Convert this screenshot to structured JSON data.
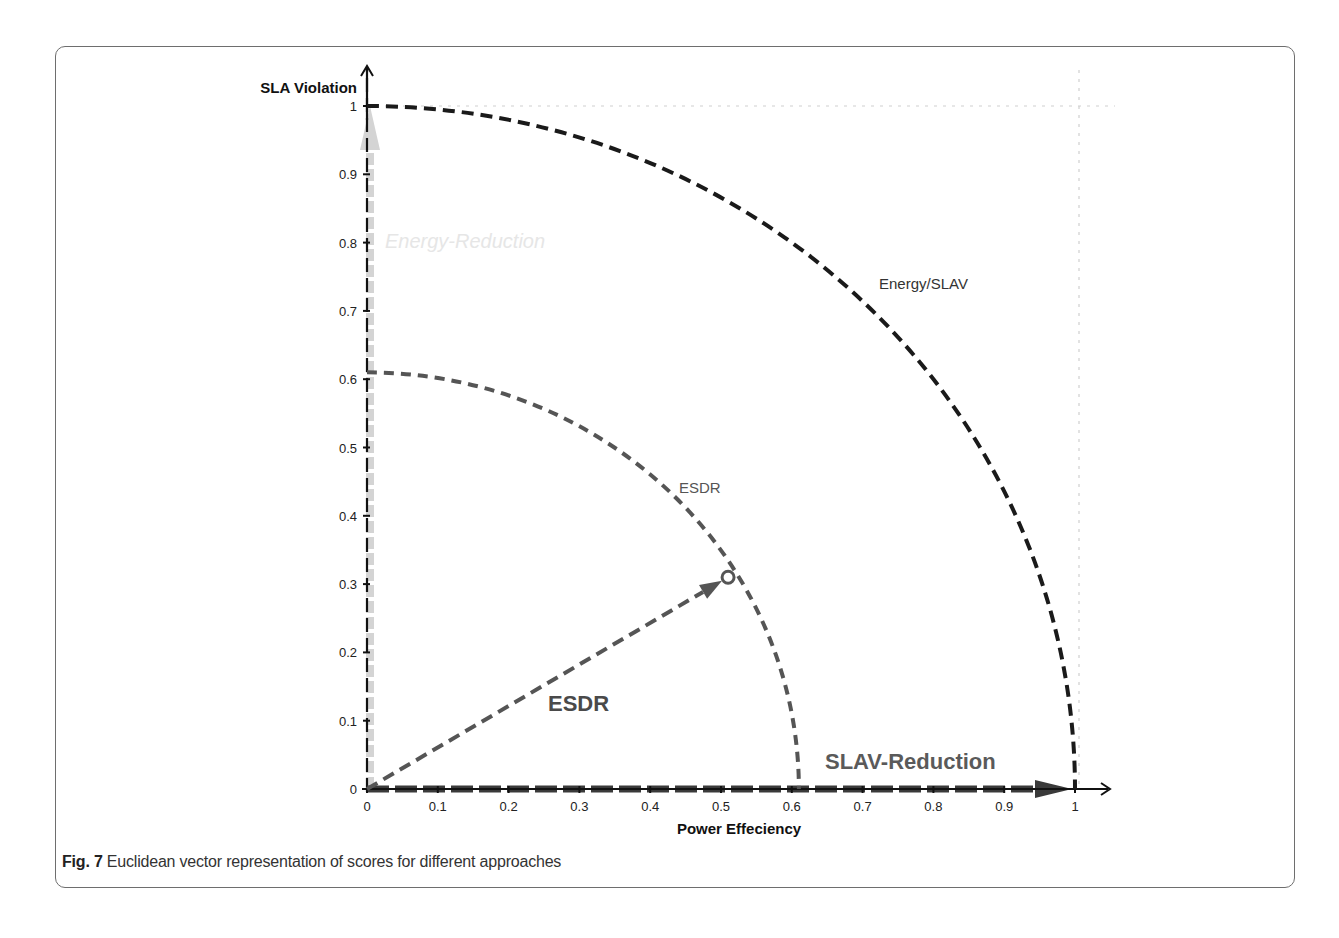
{
  "caption": {
    "label": "Fig. 7",
    "text": " Euclidean vector representation of scores for different approaches"
  },
  "colors": {
    "axis": "#111111",
    "outer_arc": "#1a1a1a",
    "inner_arc": "#555555",
    "vector": "#555555",
    "energy_arrow": "#d4d4d4",
    "slav_arrow": "#3a3a3a",
    "gridline": "#d0d0d0",
    "border": "#6e6e6e"
  },
  "chart_data": {
    "type": "scatter",
    "title": "",
    "xlabel": "Power Effeciency",
    "ylabel": "SLA Violation",
    "xlim": [
      0,
      1
    ],
    "ylim": [
      0,
      1
    ],
    "x_ticks": [
      "0",
      "0.1",
      "0.2",
      "0.3",
      "0.4",
      "0.5",
      "0.6",
      "0.7",
      "0.8",
      "0.9",
      "1"
    ],
    "y_ticks": [
      "0",
      "0.1",
      "0.2",
      "0.3",
      "0.4",
      "0.5",
      "0.6",
      "0.7",
      "0.8",
      "0.9",
      "1"
    ],
    "grid": false,
    "reference_lines": [
      {
        "type": "dotted",
        "axis": "y",
        "value": 1
      },
      {
        "type": "dotted",
        "axis": "x",
        "value": 1
      }
    ],
    "arcs": [
      {
        "name": "Energy/SLAV",
        "radius": 1.0,
        "style": "dashed",
        "label_pos": [
          0.72,
          0.74
        ]
      },
      {
        "name": "ESDR",
        "radius": 0.61,
        "style": "dashed",
        "label_pos": [
          0.44,
          0.44
        ]
      }
    ],
    "vectors": [
      {
        "name": "Energy-Reduction",
        "from": [
          0,
          0
        ],
        "to": [
          0,
          1
        ],
        "style": "light-dashed-arrow",
        "label_pos": [
          0.03,
          0.8
        ]
      },
      {
        "name": "SLAV-Reduction",
        "from": [
          0,
          0
        ],
        "to": [
          1,
          0
        ],
        "style": "dashed-arrow",
        "label_pos": [
          0.65,
          0.04
        ]
      },
      {
        "name": "ESDR",
        "from": [
          0,
          0
        ],
        "to": [
          0.51,
          0.31
        ],
        "style": "dashed-arrow",
        "label_pos": [
          0.25,
          0.12
        ]
      }
    ],
    "points": [
      {
        "name": "ESDR",
        "x": 0.51,
        "y": 0.31
      }
    ]
  }
}
